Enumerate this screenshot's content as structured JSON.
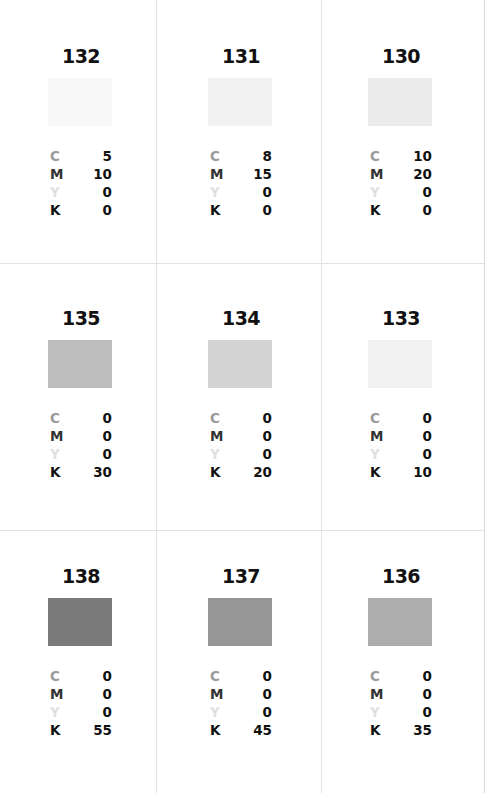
{
  "labels": {
    "c": "C",
    "m": "M",
    "y": "Y",
    "k": "K"
  },
  "swatches": [
    {
      "id": "132",
      "c": "5",
      "m": "10",
      "y": "0",
      "k": "0",
      "color": "#f8f8f8"
    },
    {
      "id": "131",
      "c": "8",
      "m": "15",
      "y": "0",
      "k": "0",
      "color": "#f1f1f1"
    },
    {
      "id": "130",
      "c": "10",
      "m": "20",
      "y": "0",
      "k": "0",
      "color": "#ebebeb"
    },
    {
      "id": "135",
      "c": "0",
      "m": "0",
      "y": "0",
      "k": "30",
      "color": "#bdbdbd"
    },
    {
      "id": "134",
      "c": "0",
      "m": "0",
      "y": "0",
      "k": "20",
      "color": "#d3d3d3"
    },
    {
      "id": "133",
      "c": "0",
      "m": "0",
      "y": "0",
      "k": "10",
      "color": "#f2f2f2"
    },
    {
      "id": "138",
      "c": "0",
      "m": "0",
      "y": "0",
      "k": "55",
      "color": "#7a7a7a"
    },
    {
      "id": "137",
      "c": "0",
      "m": "0",
      "y": "0",
      "k": "45",
      "color": "#969696"
    },
    {
      "id": "136",
      "c": "0",
      "m": "0",
      "y": "0",
      "k": "35",
      "color": "#adadad"
    }
  ]
}
